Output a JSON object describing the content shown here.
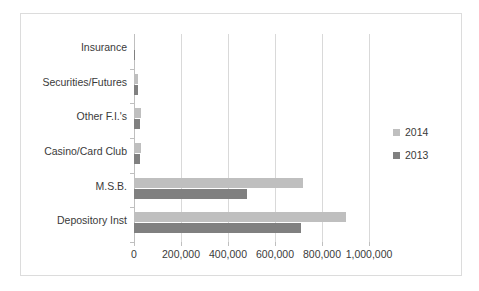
{
  "chart_data": {
    "type": "bar",
    "orientation": "horizontal",
    "title": "",
    "xlabel": "",
    "ylabel": "",
    "categories": [
      "Insurance",
      "Securities/Futures",
      "Other F.I.'s",
      "Casino/Card Club",
      "M.S.B.",
      "Depository Inst"
    ],
    "series": [
      {
        "name": "2014",
        "color": "#bfbfbf",
        "values": [
          1500,
          16000,
          30000,
          30000,
          720000,
          900000
        ]
      },
      {
        "name": "2013",
        "color": "#808080",
        "values": [
          1200,
          15000,
          24000,
          24000,
          480000,
          710000
        ]
      }
    ],
    "xlim": [
      0,
      1000000
    ],
    "xticks": [
      0,
      200000,
      400000,
      600000,
      800000,
      1000000
    ],
    "xtick_labels": [
      "0",
      "200,000",
      "400,000",
      "600,000",
      "800,000",
      "1,000,000"
    ],
    "grid": true,
    "legend_position": "right"
  },
  "legend": {
    "items": [
      {
        "label": "2014",
        "color": "#bfbfbf"
      },
      {
        "label": "2013",
        "color": "#808080"
      }
    ]
  }
}
